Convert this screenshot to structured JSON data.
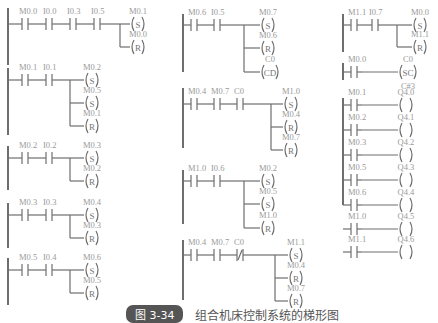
{
  "caption": {
    "badge": "图 3-34",
    "text": "组合机床控制系统的梯形图"
  },
  "rungs": [
    {
      "id": "r1",
      "contacts": [
        "M0.0",
        "I0.0",
        "I0.3",
        "I0.5"
      ],
      "coils": [
        {
          "addr": "M0.1",
          "type": "S"
        },
        {
          "addr": "M0.0",
          "type": "R"
        }
      ]
    },
    {
      "id": "r2",
      "contacts": [
        "M0.1",
        "I0.1"
      ],
      "coils": [
        {
          "addr": "M0.2",
          "type": "S"
        },
        {
          "addr": "M0.5",
          "type": "S"
        },
        {
          "addr": "M0.1",
          "type": "R"
        }
      ]
    },
    {
      "id": "r3",
      "contacts": [
        "M0.2",
        "I0.2"
      ],
      "coils": [
        {
          "addr": "M0.3",
          "type": "S"
        },
        {
          "addr": "M0.2",
          "type": "R"
        }
      ]
    },
    {
      "id": "r4",
      "contacts": [
        "M0.3",
        "I0.3"
      ],
      "coils": [
        {
          "addr": "M0.4",
          "type": "S"
        },
        {
          "addr": "M0.3",
          "type": "R"
        }
      ]
    },
    {
      "id": "r5",
      "contacts": [
        "M0.5",
        "I0.4"
      ],
      "coils": [
        {
          "addr": "M0.6",
          "type": "S"
        },
        {
          "addr": "M0.5",
          "type": "R"
        }
      ]
    },
    {
      "id": "r6",
      "contacts": [
        "M0.6",
        "I0.5"
      ],
      "coils": [
        {
          "addr": "M0.7",
          "type": "S"
        },
        {
          "addr": "M0.6",
          "type": "R"
        },
        {
          "addr": "C0",
          "type": "CD"
        }
      ]
    },
    {
      "id": "r7",
      "contacts": [
        "M0.4",
        "M0.7",
        "C0"
      ],
      "coils": [
        {
          "addr": "M1.0",
          "type": "S"
        },
        {
          "addr": "M0.4",
          "type": "R"
        },
        {
          "addr": "M0.7",
          "type": "R"
        }
      ]
    },
    {
      "id": "r8",
      "contacts": [
        "M1.0",
        "I0.6"
      ],
      "coils": [
        {
          "addr": "M0.2",
          "type": "S"
        },
        {
          "addr": "M0.5",
          "type": "S"
        },
        {
          "addr": "M1.0",
          "type": "R"
        }
      ]
    },
    {
      "id": "r9",
      "contacts": [
        "M0.4",
        "M0.7",
        "C0 (NC)"
      ],
      "coils": [
        {
          "addr": "M1.1",
          "type": "S"
        },
        {
          "addr": "M0.4",
          "type": "R"
        },
        {
          "addr": "M0.7",
          "type": "R"
        }
      ]
    },
    {
      "id": "r10",
      "contacts": [
        "M1.1",
        "I0.7"
      ],
      "coils": [
        {
          "addr": "M0.0",
          "type": "S"
        },
        {
          "addr": "M1.1",
          "type": "R"
        }
      ]
    },
    {
      "id": "r11",
      "contacts": [
        "M0.0"
      ],
      "coils": [
        {
          "addr": "C0",
          "type": "SC",
          "preset": "C#3"
        }
      ]
    },
    {
      "id": "r12",
      "contacts": [
        "M0.1"
      ],
      "coils": [
        {
          "addr": "Q4.0",
          "type": " "
        }
      ]
    },
    {
      "id": "r13",
      "contacts": [
        "M0.2"
      ],
      "coils": [
        {
          "addr": "Q4.1",
          "type": " "
        }
      ]
    },
    {
      "id": "r14",
      "contacts": [
        "M0.3"
      ],
      "coils": [
        {
          "addr": "Q4.2",
          "type": " "
        }
      ]
    },
    {
      "id": "r15",
      "contacts": [
        "M0.5"
      ],
      "coils": [
        {
          "addr": "Q4.3",
          "type": " "
        }
      ]
    },
    {
      "id": "r16",
      "contacts": [
        "M0.6"
      ],
      "coils": [
        {
          "addr": "Q4.4",
          "type": " "
        }
      ]
    },
    {
      "id": "r17",
      "contacts": [
        "M1.0"
      ],
      "coils": [
        {
          "addr": "Q4.5",
          "type": " "
        }
      ]
    },
    {
      "id": "r18",
      "contacts": [
        "M1.1"
      ],
      "coils": [
        {
          "addr": "Q4.6",
          "type": " "
        }
      ]
    }
  ]
}
